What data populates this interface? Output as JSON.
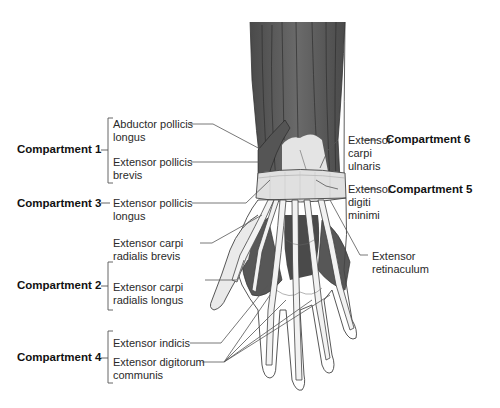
{
  "figure": {
    "colors": {
      "muscle": "#5a5a5a",
      "muscle_dark": "#3e3e3e",
      "tendon": "#e6e6e6",
      "retinaculum": "#dcdcdc",
      "outline": "#333333",
      "leader": "#555555",
      "background": "#ffffff"
    }
  },
  "compartments": {
    "c1": {
      "label": "Compartment 1",
      "muscles": [
        "Abductor pollicis longus",
        "Extensor pollicis brevis"
      ]
    },
    "c2": {
      "label": "Compartment 2",
      "muscles": [
        "Extensor carpi radialis brevis",
        "Extensor carpi radialis longus"
      ]
    },
    "c3": {
      "label": "Compartment 3",
      "muscles": [
        "Extensor pollicis longus"
      ]
    },
    "c4": {
      "label": "Compartment 4",
      "muscles": [
        "Extensor indicis",
        "Extensor digitorum communis"
      ]
    },
    "c5": {
      "label": "Compartment 5",
      "muscles": [
        "Extensor digiti minimi"
      ]
    },
    "c6": {
      "label": "Compartment 6",
      "muscles": [
        "Extensor carpi ulnaris"
      ]
    }
  },
  "labels": {
    "apl_1": "Abductor pollicis",
    "apl_2": "longus",
    "epb_1": "Extensor pollicis",
    "epb_2": "brevis",
    "epl_1": "Extensor pollicis",
    "epl_2": "longus",
    "ecrb_1": "Extensor carpi",
    "ecrb_2": "radialis brevis",
    "ecrl_1": "Extensor carpi",
    "ecrl_2": "radialis longus",
    "ei": "Extensor indicis",
    "edc_1": "Extensor digitorum",
    "edc_2": "communis",
    "ecu_1": "Extensor",
    "ecu_2": "carpi",
    "ecu_3": "ulnaris",
    "edm_1": "Extensor",
    "edm_2": "digiti",
    "edm_3": "minimi",
    "ret_1": "Extensor",
    "ret_2": "retinaculum"
  }
}
